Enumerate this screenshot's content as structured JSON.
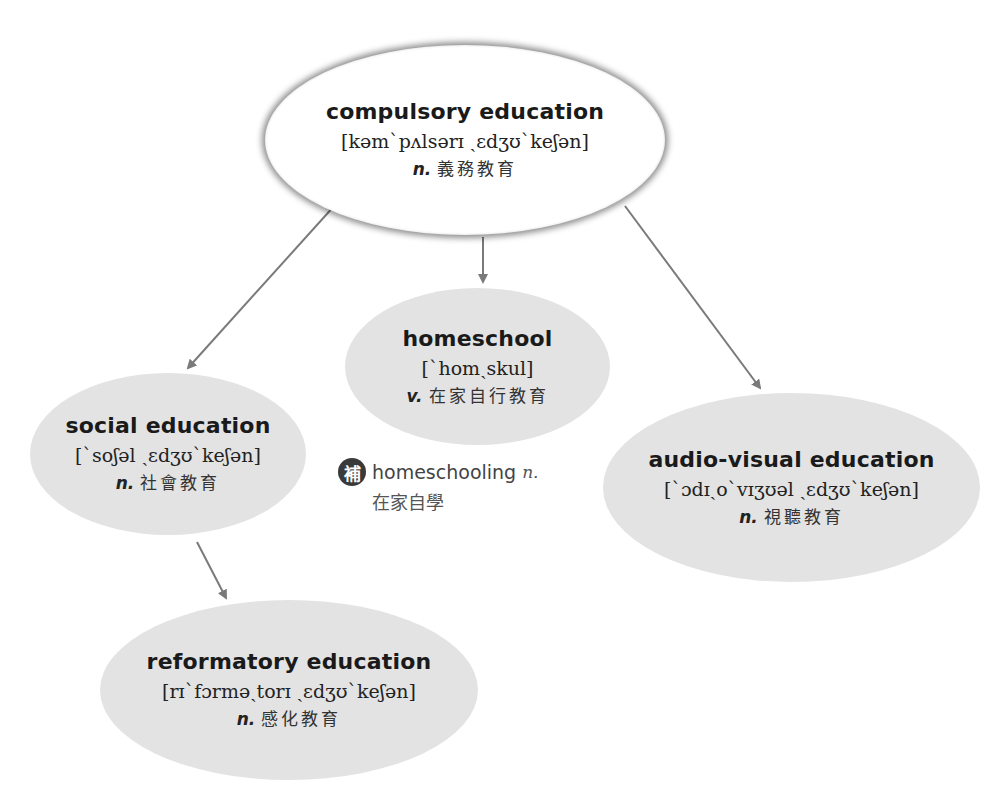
{
  "colors": {
    "root_fill": "#ffffff",
    "child_fill": "#e3e3e3",
    "arrow": "#7a7a7a",
    "badge": "#3a3a3a"
  },
  "root": {
    "term": "compulsory education",
    "ipa": "[kəm`pʌlsərɪ ˏɛdʒʊ`keʃən]",
    "pos": "n.",
    "gloss": "義務教育"
  },
  "homeschool": {
    "term": "homeschool",
    "ipa": "[`homˏskul]",
    "pos": "v.",
    "gloss": "在家自行教育"
  },
  "social": {
    "term": "social education",
    "ipa": "[`soʃəl ˏɛdʒʊ`keʃən]",
    "pos": "n.",
    "gloss": "社會教育"
  },
  "audio_visual": {
    "term": "audio-visual education",
    "ipa": "[`ɔdɪˏo`vɪʒʊəl ˏɛdʒʊ`keʃən]",
    "pos": "n.",
    "gloss": "視聽教育"
  },
  "reformatory": {
    "term": "reformatory education",
    "ipa": "[rɪ`fɔrməˏtorɪ ˏɛdʒʊ`keʃən]",
    "pos": "n.",
    "gloss": "感化教育"
  },
  "supplement": {
    "badge": "補",
    "word": "homeschooling",
    "pos": "n.",
    "gloss": "在家自學"
  }
}
